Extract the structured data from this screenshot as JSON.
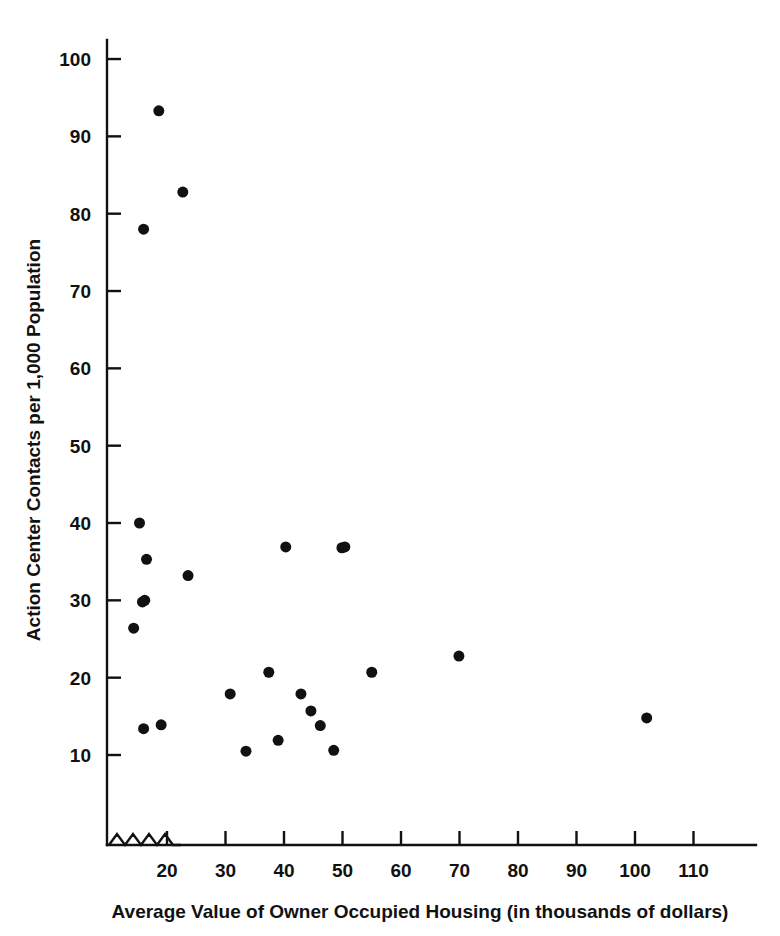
{
  "chart_data": {
    "type": "scatter",
    "title": "",
    "subtitle": "",
    "xlabel": "Average Value of Owner Occupied Housing (in thousands of dollars)",
    "ylabel": "Action Center Contacts per 1,000 Population",
    "xlim": [
      14,
      116
    ],
    "ylim": [
      0,
      104
    ],
    "xticks": [
      20,
      30,
      40,
      50,
      60,
      70,
      80,
      90,
      100,
      110
    ],
    "xtick_labels": [
      "20",
      "30",
      "40",
      "50",
      "60",
      "70",
      "80",
      "90",
      "100",
      "110"
    ],
    "yticks": [
      10,
      20,
      30,
      40,
      50,
      60,
      70,
      80,
      90,
      100
    ],
    "ytick_labels": [
      "10",
      "20",
      "30",
      "40",
      "50",
      "60",
      "70",
      "80",
      "90",
      "100"
    ],
    "grid": false,
    "legend": null,
    "axis_break": {
      "axis": "x",
      "style": "zigzag",
      "note": "zigzag break between origin and first tick"
    },
    "marker": {
      "shape": "circle",
      "color": "#111111",
      "size_px": 11
    },
    "point_count": 24,
    "points": [
      {
        "x": 18.6,
        "y": 93.3
      },
      {
        "x": 22.7,
        "y": 82.8
      },
      {
        "x": 16.0,
        "y": 78.0
      },
      {
        "x": 15.3,
        "y": 40.0
      },
      {
        "x": 16.5,
        "y": 35.3
      },
      {
        "x": 23.6,
        "y": 33.2
      },
      {
        "x": 15.8,
        "y": 29.8
      },
      {
        "x": 16.2,
        "y": 30.0
      },
      {
        "x": 14.3,
        "y": 26.4
      },
      {
        "x": 40.3,
        "y": 36.9
      },
      {
        "x": 50.4,
        "y": 36.9
      },
      {
        "x": 49.9,
        "y": 36.8
      },
      {
        "x": 37.4,
        "y": 20.7
      },
      {
        "x": 55.0,
        "y": 20.7
      },
      {
        "x": 69.9,
        "y": 22.8
      },
      {
        "x": 102.0,
        "y": 14.8
      },
      {
        "x": 30.8,
        "y": 17.9
      },
      {
        "x": 42.9,
        "y": 17.9
      },
      {
        "x": 44.6,
        "y": 15.7
      },
      {
        "x": 46.2,
        "y": 13.8
      },
      {
        "x": 16.0,
        "y": 13.4
      },
      {
        "x": 19.0,
        "y": 13.9
      },
      {
        "x": 39.0,
        "y": 11.9
      },
      {
        "x": 48.5,
        "y": 10.6
      },
      {
        "x": 33.5,
        "y": 10.5
      }
    ]
  },
  "figure": {
    "background_color": "#ffffff",
    "foreground_color": "#111111"
  }
}
